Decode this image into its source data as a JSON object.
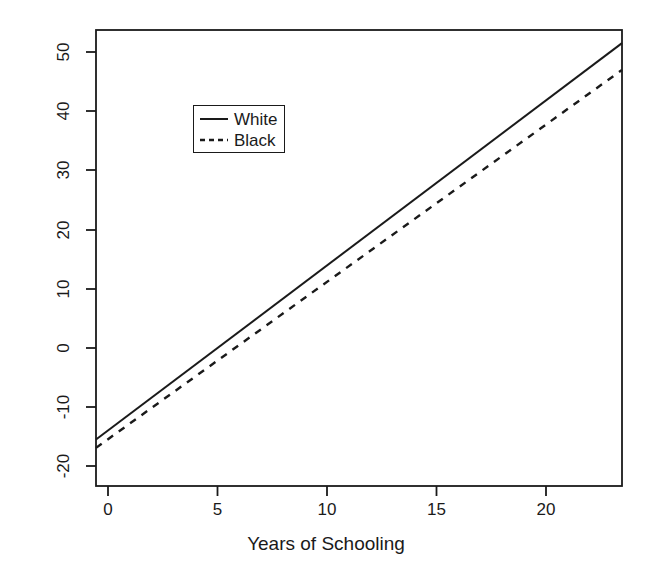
{
  "chart_data": {
    "type": "line",
    "title": "",
    "subtitle": "",
    "xlabel": "Years of Schooling",
    "ylabel": "Expected Income (in $1000s)",
    "xlim": [
      -0.55,
      21.5
    ],
    "ylim": [
      -23.0,
      53.5
    ],
    "xticks": [
      0,
      5,
      10,
      15,
      20
    ],
    "xtick_labels": [
      "0",
      "5",
      "10",
      "15",
      "20"
    ],
    "yticks": [
      -20,
      -10,
      0,
      10,
      20,
      30,
      40,
      50
    ],
    "ytick_labels": [
      "-20",
      "-10",
      "0",
      "10",
      "20",
      "30",
      "40",
      "50"
    ],
    "grid": false,
    "legend_position": "upper-left-inside",
    "series": [
      {
        "name": "White",
        "style": "solid",
        "color": "#1a1a1a",
        "x": [
          -0.55,
          21.5
        ],
        "values": [
          -15.2,
          51.3
        ],
        "intercept": -13.5,
        "slope": 3.02
      },
      {
        "name": "Black",
        "style": "dashed",
        "color": "#1a1a1a",
        "x": [
          -0.55,
          21.5
        ],
        "values": [
          -16.6,
          46.8
        ],
        "intercept": -15.0,
        "slope": 2.88
      }
    ]
  },
  "legend": {
    "entries": [
      {
        "label": "White",
        "style": "solid"
      },
      {
        "label": "Black",
        "style": "dashed"
      }
    ]
  },
  "axes": {
    "x_title": "Years of Schooling",
    "y_title": "Expected Income (in $1000s)",
    "x_tick_0": "0",
    "x_tick_1": "5",
    "x_tick_2": "10",
    "x_tick_3": "15",
    "x_tick_4": "20",
    "y_tick_0": "50",
    "y_tick_1": "40",
    "y_tick_2": "30",
    "y_tick_3": "20",
    "y_tick_4": "10",
    "y_tick_5": "0",
    "y_tick_6": "-10",
    "y_tick_7": "-20"
  },
  "colors": {
    "foreground": "#1a1a1a",
    "background": "#ffffff"
  }
}
